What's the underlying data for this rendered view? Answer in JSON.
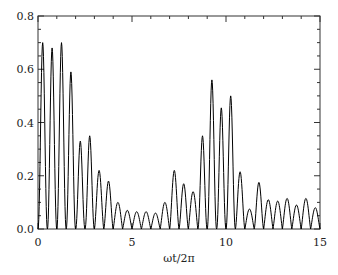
{
  "chart_data": {
    "type": "line",
    "title": "",
    "xlabel": "ωt/2π",
    "ylabel": "",
    "xlim": [
      0,
      15
    ],
    "ylim": [
      0,
      0.8
    ],
    "x_ticks": [
      0,
      5,
      10,
      15
    ],
    "x_tick_labels": [
      "0",
      "5",
      "10",
      "15"
    ],
    "x_minor_step": 1,
    "y_ticks": [
      0.0,
      0.2,
      0.4,
      0.6,
      0.8
    ],
    "y_tick_labels": [
      "0.0",
      "0.2",
      "0.4",
      "0.6",
      "0.8"
    ],
    "y_minor_step": 0.05,
    "grid": false,
    "legend": "none",
    "line_color": "#000000",
    "series": [
      {
        "name": "signal",
        "description": "oscillating pulses; each pulse spans half a unit of ωt/2π, returning to 0 between pulses",
        "pulse_width": 0.5,
        "peak_x": [
          0.25,
          0.75,
          1.25,
          1.75,
          2.25,
          2.75,
          3.25,
          3.75,
          4.25,
          4.75,
          5.25,
          5.75,
          6.25,
          6.75,
          7.25,
          7.75,
          8.25,
          8.75,
          9.25,
          9.75,
          10.25,
          10.75,
          11.25,
          11.75,
          12.25,
          12.75,
          13.25,
          13.75,
          14.25,
          14.75
        ],
        "peak_y": [
          0.7,
          0.68,
          0.7,
          0.59,
          0.33,
          0.35,
          0.22,
          0.18,
          0.1,
          0.07,
          0.065,
          0.065,
          0.06,
          0.1,
          0.22,
          0.17,
          0.14,
          0.35,
          0.56,
          0.455,
          0.5,
          0.215,
          0.075,
          0.175,
          0.11,
          0.105,
          0.115,
          0.09,
          0.115,
          0.08
        ]
      }
    ]
  }
}
